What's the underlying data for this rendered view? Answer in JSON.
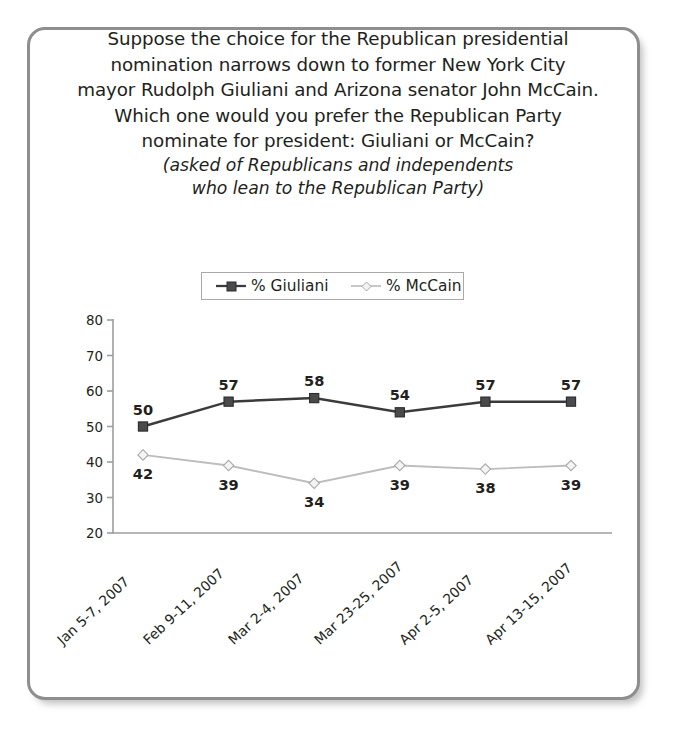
{
  "frame": {
    "border_color": "#8e8e90"
  },
  "title": {
    "lines": [
      "Suppose the choice for the Republican presidential",
      "nomination narrows down to former New York City",
      "mayor Rudolph Giuliani and Arizona senator John McCain.",
      "Which one would you prefer the Republican Party",
      "nominate for president: Giuliani or McCain?"
    ],
    "subtitle_lines": [
      "(asked of Republicans and independents",
      "who lean to the Republican Party)"
    ]
  },
  "legend": {
    "entries": [
      {
        "label": "% Giuliani",
        "marker": "filled-square-marker",
        "color": "#3b3b3d"
      },
      {
        "label": "% McCain",
        "marker": "open-diamond-marker",
        "color": "#bdbdbf"
      }
    ]
  },
  "chart_data": {
    "type": "line",
    "subtitle": "(asked of Republicans and independents who lean to the Republican Party)",
    "xlabel": "",
    "ylabel": "",
    "ylim": [
      20,
      80
    ],
    "yticks": [
      20,
      30,
      40,
      50,
      60,
      70,
      80
    ],
    "grid": false,
    "legend_position": "top-center",
    "categories": [
      "Jan 5-7, 2007",
      "Feb 9-11, 2007",
      "Mar 2-4, 2007",
      "Mar 23-25, 2007",
      "Apr 2-5, 2007",
      "Apr 13-15, 2007"
    ],
    "series": [
      {
        "name": "% Giuliani",
        "color": "#3b3b3d",
        "marker": "filled-square-marker",
        "values": [
          50,
          57,
          58,
          54,
          57,
          57
        ],
        "label_position": [
          "above",
          "above",
          "above",
          "above",
          "above",
          "above"
        ]
      },
      {
        "name": "% McCain",
        "color": "#bdbdbf",
        "marker": "open-diamond-marker",
        "values": [
          42,
          39,
          34,
          39,
          38,
          39
        ],
        "label_position": [
          "below",
          "below",
          "below",
          "below",
          "below",
          "below"
        ]
      }
    ]
  }
}
